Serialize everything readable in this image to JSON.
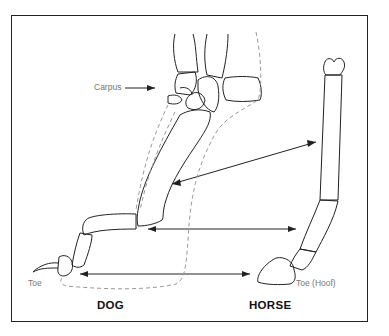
{
  "diagram": {
    "labels": {
      "carpus": "Carpus",
      "dog_toe": "Toe",
      "horse_toe": "Toe (Hoof)"
    },
    "titles": {
      "dog": "DOG",
      "horse": "HORSE"
    },
    "colors": {
      "line": "#222222",
      "dashed": "#999999",
      "label": "#777777"
    }
  }
}
